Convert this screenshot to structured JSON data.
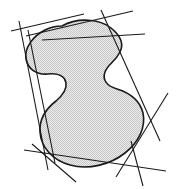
{
  "figure": {
    "background_color": "#ffffff",
    "width": 176,
    "height": 189
  },
  "blob": {
    "name": "shaded-region",
    "fill_color": "#d5d5d5",
    "stroke_color": "#1a1a1a",
    "stroke_width": 1.6,
    "fill_pattern": "fine-stipple",
    "pattern_dot_color": "#b8b8b8",
    "pattern_background": "#efefef",
    "path": "M 62 26 C 78 17, 100 19, 111 28 C 121 36, 124 44, 120 52 C 115 62, 108 64, 105 72 C 102 80, 107 86, 117 89 C 130 93, 140 101, 143 113 C 146 127, 139 142, 125 153 C 110 165, 88 170, 70 165 C 52 160, 41 147, 40 132 C 39 118, 47 108, 56 101 C 63 95, 67 89, 66 83 C 65 76, 58 73, 48 74 C 36 75, 28 69, 26 59 C 24 48, 33 36, 45 30 C 51 27, 57 26, 62 26 Z"
  },
  "tangent_lines": [
    {
      "name": "tangent-top-left-shallow",
      "x1": 11,
      "y1": 31,
      "x2": 84,
      "y2": 14,
      "color": "#1a1a1a",
      "width": 1.1
    },
    {
      "name": "tangent-top-upper",
      "x1": 26,
      "y1": 36,
      "x2": 133,
      "y2": 11,
      "color": "#1a1a1a",
      "width": 1.1
    },
    {
      "name": "tangent-top-right-flat",
      "x1": 42,
      "y1": 40,
      "x2": 145,
      "y2": 34,
      "color": "#1a1a1a",
      "width": 1.1
    },
    {
      "name": "tangent-left-steep-long",
      "x1": 19,
      "y1": 21,
      "x2": 48,
      "y2": 170,
      "color": "#1a1a1a",
      "width": 1.1
    },
    {
      "name": "tangent-left-vertical",
      "x1": 28,
      "y1": 30,
      "x2": 55,
      "y2": 163,
      "color": "#1a1a1a",
      "width": 1.1
    },
    {
      "name": "tangent-right-descending",
      "x1": 101,
      "y1": 10,
      "x2": 160,
      "y2": 141,
      "color": "#1a1a1a",
      "width": 1.1
    },
    {
      "name": "tangent-right-lower",
      "x1": 168,
      "y1": 93,
      "x2": 116,
      "y2": 177,
      "color": "#1a1a1a",
      "width": 1.1
    },
    {
      "name": "tangent-bottom-shallow",
      "x1": 24,
      "y1": 150,
      "x2": 166,
      "y2": 171,
      "color": "#1a1a1a",
      "width": 1.1
    },
    {
      "name": "tangent-bottom-crossing",
      "x1": 32,
      "y1": 144,
      "x2": 76,
      "y2": 182,
      "color": "#1a1a1a",
      "width": 1.1
    },
    {
      "name": "tangent-bottom-right-short",
      "x1": 143,
      "y1": 186,
      "x2": 131,
      "y2": 141,
      "color": "#1a1a1a",
      "width": 1.1
    }
  ]
}
